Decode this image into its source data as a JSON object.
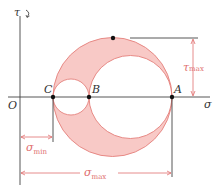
{
  "diagram": {
    "axes": {
      "x_label": "σ",
      "y_label": "τ",
      "origin_label": "O"
    },
    "points": [
      {
        "label": "C",
        "x": 53
      },
      {
        "label": "B",
        "x": 89
      },
      {
        "label": "A",
        "x": 172
      }
    ],
    "dimensions": {
      "tau_max": "τ",
      "tau_max_sub": "max",
      "sigma_min": "σ",
      "sigma_min_sub": "min",
      "sigma_max": "σ",
      "sigma_max_sub": "max"
    },
    "colors": {
      "fill": "#f8c9c6",
      "stroke": "#e4807c",
      "dim": "#e06e6e",
      "axis": "#444444"
    }
  }
}
